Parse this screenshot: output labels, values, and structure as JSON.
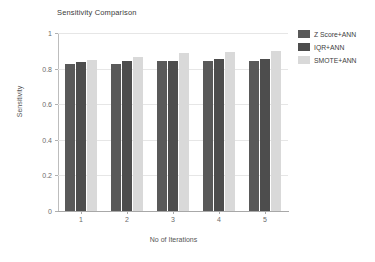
{
  "chart_data": {
    "type": "bar",
    "title": "Sensitivity Comparison",
    "xlabel": "No of Iterations",
    "ylabel": "Sensitivity",
    "categories": [
      "1",
      "2",
      "3",
      "4",
      "5"
    ],
    "series": [
      {
        "name": "Z Score+ANN",
        "color": "#595959",
        "values": [
          0.825,
          0.825,
          0.845,
          0.845,
          0.845
        ]
      },
      {
        "name": "IQR+ANN",
        "color": "#4d4d4d",
        "values": [
          0.835,
          0.845,
          0.845,
          0.855,
          0.855
        ]
      },
      {
        "name": "SMOTE+ANN",
        "color": "#d9d9d9",
        "values": [
          0.85,
          0.865,
          0.885,
          0.895,
          0.9
        ]
      }
    ],
    "ylim": [
      0,
      1
    ],
    "yticks": [
      0,
      0.2,
      0.4,
      0.6,
      0.8,
      1
    ],
    "ytick_labels": [
      "0",
      "0.2",
      "0.4",
      "0.6",
      "0.8",
      "1"
    ],
    "grid": true,
    "grid_axis": "y",
    "legend_position": "right"
  }
}
